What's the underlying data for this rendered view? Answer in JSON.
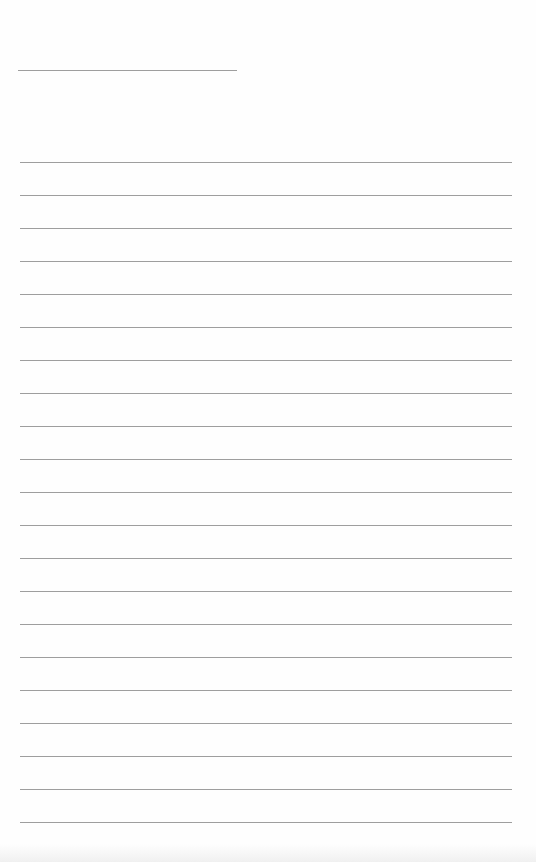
{
  "page": {
    "type": "lined-paper",
    "background_color": "#fefefe",
    "line_color": "#9e9e9e",
    "header_line": {
      "x": 18,
      "y": 70,
      "width": 219
    },
    "ruled_lines": {
      "count": 21,
      "first_y": 162,
      "spacing": 33,
      "x": 20,
      "width": 492
    }
  }
}
